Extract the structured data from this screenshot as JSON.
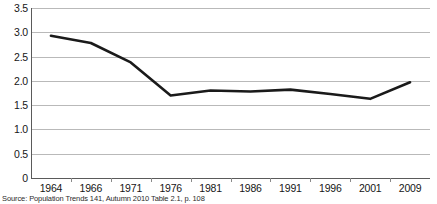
{
  "chart_data": {
    "type": "line",
    "title": "",
    "xlabel": "",
    "ylabel": "",
    "categories": [
      "1964",
      "1966",
      "1971",
      "1976",
      "1981",
      "1986",
      "1991",
      "1996",
      "2001",
      "2009"
    ],
    "values": [
      2.93,
      2.78,
      2.38,
      1.7,
      1.8,
      1.78,
      1.82,
      1.73,
      1.63,
      1.97
    ],
    "series": [
      {
        "name": "Total fertility rate",
        "values": [
          2.93,
          2.78,
          2.38,
          1.7,
          1.8,
          1.78,
          1.82,
          1.73,
          1.63,
          1.97
        ]
      }
    ],
    "ylim": [
      0,
      3.5
    ],
    "y_ticks": [
      "3.5",
      "3.0",
      "2.5",
      "2.0",
      "1.5",
      "1.0",
      "0.5",
      "0"
    ],
    "y_tick_values": [
      3.5,
      3.0,
      2.5,
      2.0,
      1.5,
      1.0,
      0.5,
      0
    ],
    "grid": true,
    "grid_axis": "y",
    "legend": "none",
    "line_color": "#1a1a1a",
    "grid_color": "#b9b9b9",
    "axis_color": "#5a5a5a",
    "background_color": "#ffffff"
  },
  "caption": {
    "source": "Source: Population Trends 141, Autumn 2010 Table 2.1, p. 108"
  }
}
